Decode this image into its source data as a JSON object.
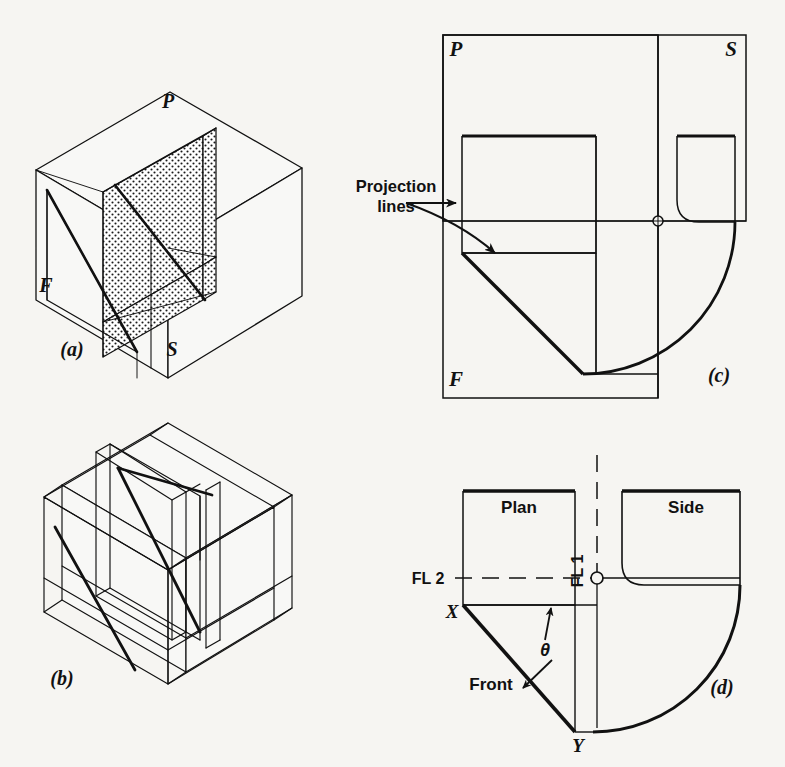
{
  "figure": {
    "background_color": "#f6f5f2",
    "ink_color": "#111111"
  },
  "panels": [
    {
      "key": "a",
      "caption": "(a)",
      "description": "Pictorial glass box with stippled oblique plane",
      "plane_labels": [
        {
          "name": "P",
          "text": "P"
        },
        {
          "name": "F",
          "text": "F"
        },
        {
          "name": "S",
          "text": "S"
        }
      ]
    },
    {
      "key": "b",
      "caption": "(b)",
      "description": "Pictorial glass box opening up, projection planes hinged"
    },
    {
      "key": "c",
      "caption": "(c)",
      "description": "Glass box partially unfolded showing rotation of planes",
      "plane_labels": [
        {
          "name": "P",
          "text": "P"
        },
        {
          "name": "S",
          "text": "S"
        },
        {
          "name": "F",
          "text": "F"
        }
      ],
      "annotation": {
        "name": "projection-lines",
        "line1": "Projection",
        "line2": "lines"
      }
    },
    {
      "key": "d",
      "caption": "(d)",
      "description": "Completed three-view orthographic drawing",
      "view_labels": [
        {
          "name": "plan-view-label",
          "text": "Plan"
        },
        {
          "name": "side-view-label",
          "text": "Side"
        },
        {
          "name": "front-view-label",
          "text": "Front"
        }
      ],
      "fold_lines": [
        {
          "name": "fold-line-1",
          "text": "FL 1"
        },
        {
          "name": "fold-line-2",
          "text": "FL 2"
        }
      ],
      "point_labels": [
        {
          "name": "point-x",
          "text": "X"
        },
        {
          "name": "point-y",
          "text": "Y"
        }
      ],
      "angle_label": {
        "name": "theta",
        "text": "θ"
      }
    }
  ]
}
